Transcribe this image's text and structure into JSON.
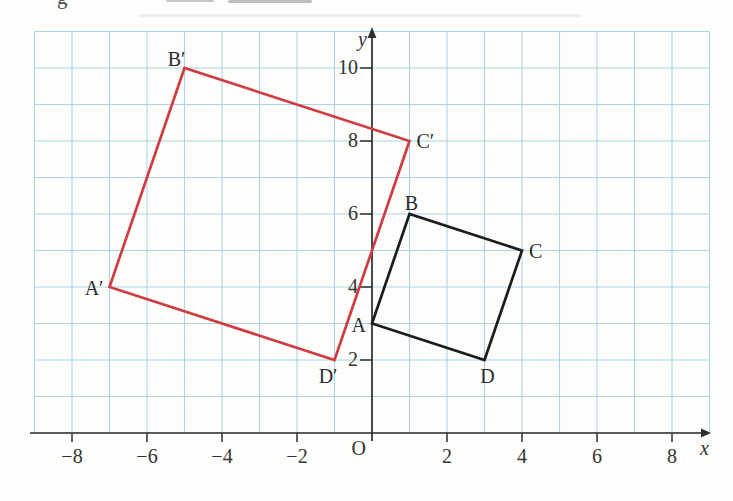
{
  "fragments": {
    "letter": "g"
  },
  "figure": {
    "origin_label": "O",
    "x_axis_label": "x",
    "y_axis_label": "y"
  },
  "colors": {
    "grid": "#a9d5e5",
    "axis": "#2e2e2e",
    "tick_text": "#333333",
    "vertex_text": "#2b2b2b",
    "original_shape": "#1c1c1c",
    "image_shape": "#d13b42"
  },
  "chart_data": {
    "type": "line",
    "title": "",
    "xlabel": "x",
    "ylabel": "y",
    "origin_label": "O",
    "xlim": [
      -9,
      9
    ],
    "ylim": [
      0,
      11
    ],
    "grid": true,
    "x_ticks": [
      -8,
      -6,
      -4,
      -2,
      2,
      4,
      6,
      8
    ],
    "x_tick_labels": [
      "−8",
      "−6",
      "−4",
      "−2",
      "2",
      "4",
      "6",
      "8"
    ],
    "y_ticks": [
      2,
      4,
      6,
      8,
      10
    ],
    "y_tick_labels": [
      "2",
      "4",
      "6",
      "8",
      "10"
    ],
    "series": [
      {
        "name": "quadrilateral ABCD",
        "color_key": "original_shape",
        "closed": true,
        "points": [
          {
            "label": "A",
            "x": 0,
            "y": 3,
            "label_pos": "left"
          },
          {
            "label": "B",
            "x": 1,
            "y": 6,
            "label_pos": "above"
          },
          {
            "label": "C",
            "x": 4,
            "y": 5,
            "label_pos": "right"
          },
          {
            "label": "D",
            "x": 3,
            "y": 2,
            "label_pos": "below"
          }
        ]
      },
      {
        "name": "quadrilateral A′B′C′D′ (enlargement)",
        "color_key": "image_shape",
        "closed": true,
        "points": [
          {
            "label": "A′",
            "x": -7,
            "y": 4,
            "label_pos": "left"
          },
          {
            "label": "B′",
            "x": -5,
            "y": 10,
            "label_pos": "above-left"
          },
          {
            "label": "C′",
            "x": 1,
            "y": 8,
            "label_pos": "right"
          },
          {
            "label": "D′",
            "x": -1,
            "y": 2,
            "label_pos": "below-left"
          }
        ]
      }
    ]
  }
}
